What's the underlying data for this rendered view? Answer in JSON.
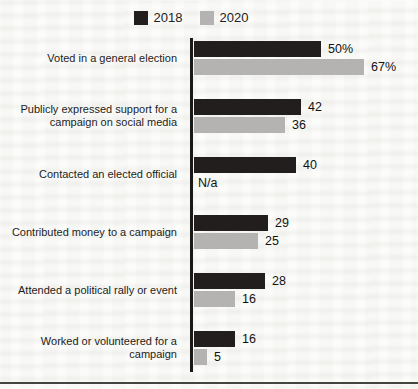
{
  "chart_data": {
    "type": "bar",
    "orientation": "horizontal",
    "title": "",
    "xlabel": "",
    "ylabel": "",
    "xlim": [
      0,
      70
    ],
    "grid": false,
    "legend_position": "top",
    "axis_color": "#191917",
    "categories": [
      "Voted in a general election",
      "Publicly expressed support for a campaign on social media",
      "Contacted an elected official",
      "Contributed money to a campaign",
      "Attended a political rally or event",
      "Worked or volunteered for a campaign"
    ],
    "series": [
      {
        "name": "2018",
        "color": "#221e1e",
        "values": [
          50,
          42,
          40,
          29,
          28,
          16
        ],
        "value_labels": [
          "50%",
          "42",
          "40",
          "29",
          "28",
          "16"
        ]
      },
      {
        "name": "2020",
        "color": "#b4b3b1",
        "values": [
          67,
          36,
          null,
          25,
          16,
          5
        ],
        "value_labels": [
          "67%",
          "36",
          "N/a",
          "25",
          "16",
          "5"
        ]
      }
    ],
    "missing_value_label": "N/a"
  }
}
